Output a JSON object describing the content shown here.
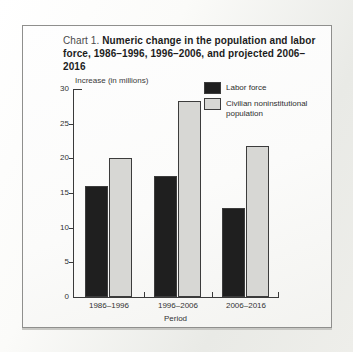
{
  "chart": {
    "title_prefix": "Chart 1.",
    "title_main": "Numeric change in the population and labor force, 1986–1996, 1996–2006, and projected 2006–2016"
  },
  "chart_data": {
    "type": "bar",
    "title": "Chart 1. Numeric change in the population and labor force, 1986–1996, 1996–2006, and projected 2006–2016",
    "categories": [
      "1986–1996",
      "1996–2006",
      "2006–2016"
    ],
    "series": [
      {
        "name": "Labor force",
        "color": "#1f1f1f",
        "values": [
          16.0,
          17.5,
          12.8
        ]
      },
      {
        "name": "Civilian noninstitutional population",
        "color": "#d7d7d4",
        "values": [
          20.0,
          28.2,
          21.8
        ]
      }
    ],
    "xlabel": "Period",
    "ylabel": "Increase (in millions)",
    "ylim": [
      0,
      30
    ],
    "ytick_step": 5,
    "grid": false,
    "legend_position": "top-right",
    "bar_border_color": "#3c3c3c",
    "axis_color": "#3a3a3a"
  }
}
